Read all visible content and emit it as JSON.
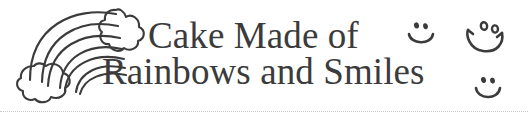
{
  "banner": {
    "background_color": "#ffffff",
    "ink_color": "#3b3b3c",
    "rule_color": "#c9c9c9",
    "headline": {
      "line_1": "Cake Made of",
      "line_2": "Rainbows and Smiles"
    },
    "artwork": {
      "rainbow_label": "rainbow-with-clouds",
      "arc_count": 4,
      "cloud_count": 2
    },
    "doodles": [
      {
        "name": "smiley-face-small-top",
        "expression": "smile"
      },
      {
        "name": "smiley-face-large-top",
        "expression": "smile-with-upturned-ends"
      },
      {
        "name": "smiley-face-small-bottom",
        "expression": "smile"
      }
    ]
  }
}
